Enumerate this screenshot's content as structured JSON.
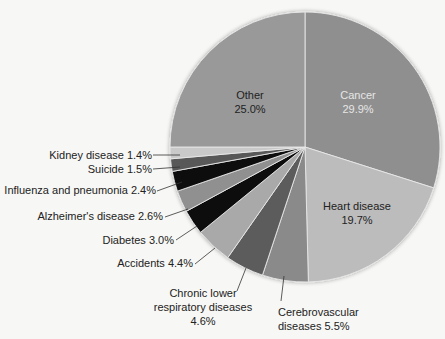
{
  "chart_data": {
    "type": "pie",
    "title": "",
    "start_angle_deg": 0,
    "direction": "clockwise",
    "slices": [
      {
        "label": "Cancer",
        "value": 29.9,
        "color": "#8f8f8f",
        "text_color": "#e6e6e6"
      },
      {
        "label": "Heart disease",
        "value": 19.7,
        "color": "#bcbcbc",
        "text_color": "#222222"
      },
      {
        "label": "Cerebrovascular diseases",
        "value": 5.5,
        "color": "#8a8a8a",
        "text_color": "#222222"
      },
      {
        "label": "Chronic lower respiratory diseases",
        "value": 4.6,
        "color": "#5b5b5b",
        "text_color": "#222222"
      },
      {
        "label": "Accidents",
        "value": 4.4,
        "color": "#a9a9a9",
        "text_color": "#222222"
      },
      {
        "label": "Diabetes",
        "value": 3.0,
        "color": "#0d0d0d",
        "text_color": "#222222"
      },
      {
        "label": "Alzheimer's disease",
        "value": 2.6,
        "color": "#909090",
        "text_color": "#222222"
      },
      {
        "label": "Influenza and pneumonia",
        "value": 2.4,
        "color": "#0d0d0d",
        "text_color": "#222222"
      },
      {
        "label": "Suicide",
        "value": 1.5,
        "color": "#585858",
        "text_color": "#222222"
      },
      {
        "label": "Kidney disease",
        "value": 1.4,
        "color": "#c9c9c9",
        "text_color": "#222222"
      },
      {
        "label": "Other",
        "value": 25.0,
        "color": "#999999",
        "text_color": "#222222"
      }
    ],
    "legend": "none (labels placed on/next to slices)"
  },
  "labels": {
    "cancer": {
      "line1": "Cancer",
      "line2": "29.9%"
    },
    "heart": {
      "line1": "Heart disease",
      "line2": "19.7%"
    },
    "other": {
      "line1": "Other",
      "line2": "25.0%"
    },
    "cerebro": {
      "line1": "Cerebrovascular",
      "line2": "diseases 5.5%"
    },
    "chronic": {
      "line1": "Chronic lower",
      "line2": "respiratory diseases",
      "line3": "4.6%"
    },
    "accidents": "Accidents 4.4%",
    "diabetes": "Diabetes 3.0%",
    "alzheimers": "Alzheimer's disease 2.6%",
    "influenza": "Influenza and pneumonia 2.4%",
    "suicide": "Suicide 1.5%",
    "kidney": "Kidney disease 1.4%"
  }
}
